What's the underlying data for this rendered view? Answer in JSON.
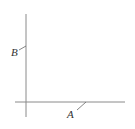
{
  "diagram": {
    "type": "coordinate-axes",
    "colors": {
      "axis": "#888888",
      "label": "#333333",
      "background": "#ffffff"
    },
    "points": [
      {
        "name": "B",
        "label": "B",
        "on": "vertical-axis"
      },
      {
        "name": "A",
        "label": "A",
        "on": "horizontal-axis"
      }
    ]
  }
}
